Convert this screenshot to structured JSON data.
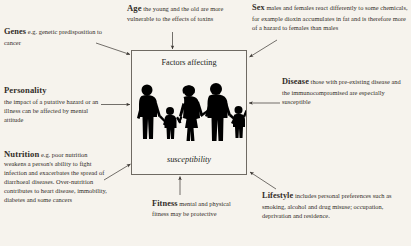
{
  "center": {
    "title": "Factors affecting",
    "subtitle": "susceptibility",
    "illustration": "family-silhouette-icon"
  },
  "notes": {
    "genes": {
      "lead": "Genes",
      "body": "e.g. genetic predisposition to cancer"
    },
    "personality": {
      "lead": "Personality",
      "body": "the impact of a putative hazard or an illness can be affected by mental attitude"
    },
    "nutrition": {
      "lead": "Nutrition",
      "body": "e.g. poor nutrition weakens a person's ability to fight infection and exacerbates the spread of diarrhoeal diseases. Over-nutrition contributes to heart disease, immobility, diabetes and some cancers"
    },
    "age": {
      "lead": "Age",
      "body": "the young and the old are more vulnerable to the effects of toxins"
    },
    "sex": {
      "lead": "Sex",
      "body": "males and females react differently to some chemicals, for example dioxin accumulates in fat and is therefore more of a hazard to females than males"
    },
    "disease": {
      "lead": "Disease",
      "body": "those with pre-existing disease and the immunocompromised are especially susceptible"
    },
    "lifestyle": {
      "lead": "Lifestyle",
      "body": "includes personal preferences such as smoking, alcohol and drug misuse; occupation, deprivation and residence."
    },
    "fitness": {
      "lead": "Fitness",
      "body": "mental and physical fitness may be protective"
    }
  },
  "colors": {
    "background": "#f6f3ed",
    "text": "#2b2724",
    "box_border": "#6f6a63",
    "silhouette": "#000000",
    "arrow": "#3a3531"
  }
}
